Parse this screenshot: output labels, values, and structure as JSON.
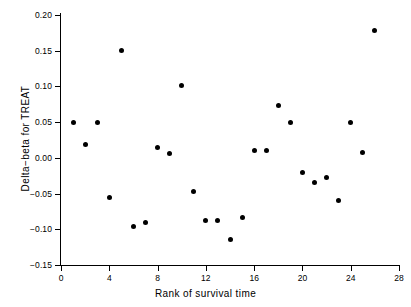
{
  "chart_data": {
    "type": "scatter",
    "title": "",
    "xlabel": "Rank of survival time",
    "ylabel": "Delta−beta for TREAT",
    "xlim": [
      0,
      28
    ],
    "ylim": [
      -0.15,
      0.2
    ],
    "grid": false,
    "legend": null,
    "xticks": [
      "0",
      "4",
      "8",
      "12",
      "16",
      "20",
      "24",
      "28"
    ],
    "xtick_values": [
      0,
      4,
      8,
      12,
      16,
      20,
      24,
      28
    ],
    "yticks": [
      "0.20",
      "0.15",
      "0.10",
      "0.05",
      "0.00",
      "-0.05",
      "-0.10",
      "-0.15"
    ],
    "ytick_values": [
      0.2,
      0.15,
      0.1,
      0.05,
      0.0,
      -0.05,
      -0.1,
      -0.15
    ],
    "marker": "filled-circle",
    "marker_color": "#000000",
    "x": [
      1,
      2,
      3,
      4,
      5,
      6,
      7,
      8,
      9,
      10,
      11,
      12,
      13,
      14,
      15,
      16,
      17,
      18,
      19,
      20,
      21,
      22,
      23,
      24,
      25,
      26
    ],
    "y": [
      0.049,
      0.019,
      0.05,
      -0.056,
      0.15,
      -0.096,
      -0.091,
      0.015,
      0.006,
      0.102,
      -0.047,
      -0.088,
      -0.088,
      -0.114,
      -0.083,
      0.011,
      0.011,
      0.073,
      0.05,
      -0.02,
      -0.035,
      -0.028,
      -0.06,
      0.049,
      0.008,
      0.179
    ],
    "points": [
      {
        "rank": 1,
        "delta_beta": 0.049
      },
      {
        "rank": 2,
        "delta_beta": 0.019
      },
      {
        "rank": 3,
        "delta_beta": 0.05
      },
      {
        "rank": 4,
        "delta_beta": -0.056
      },
      {
        "rank": 5,
        "delta_beta": 0.15
      },
      {
        "rank": 6,
        "delta_beta": -0.096
      },
      {
        "rank": 7,
        "delta_beta": -0.091
      },
      {
        "rank": 8,
        "delta_beta": 0.015
      },
      {
        "rank": 9,
        "delta_beta": 0.006
      },
      {
        "rank": 10,
        "delta_beta": 0.102
      },
      {
        "rank": 11,
        "delta_beta": -0.047
      },
      {
        "rank": 12,
        "delta_beta": -0.088
      },
      {
        "rank": 13,
        "delta_beta": -0.088
      },
      {
        "rank": 14,
        "delta_beta": -0.114
      },
      {
        "rank": 15,
        "delta_beta": -0.083
      },
      {
        "rank": 16,
        "delta_beta": 0.011
      },
      {
        "rank": 17,
        "delta_beta": 0.011
      },
      {
        "rank": 18,
        "delta_beta": 0.073
      },
      {
        "rank": 19,
        "delta_beta": 0.05
      },
      {
        "rank": 20,
        "delta_beta": -0.02
      },
      {
        "rank": 21,
        "delta_beta": -0.035
      },
      {
        "rank": 22,
        "delta_beta": -0.028
      },
      {
        "rank": 23,
        "delta_beta": -0.06
      },
      {
        "rank": 24,
        "delta_beta": 0.049
      },
      {
        "rank": 25,
        "delta_beta": 0.008
      },
      {
        "rank": 26,
        "delta_beta": 0.179
      }
    ]
  }
}
